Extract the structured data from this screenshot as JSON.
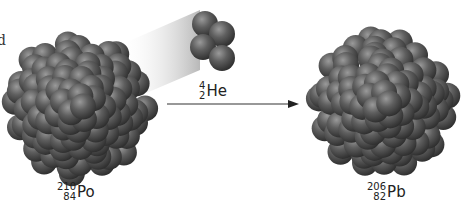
{
  "figure": {
    "edge_text": "d",
    "parent": {
      "mass": "210",
      "atomic": "84",
      "symbol": "Po",
      "nucleons_drawn": 90
    },
    "alpha": {
      "mass": "4",
      "atomic": "2",
      "symbol": "He",
      "nucleons_drawn": 4
    },
    "daughter": {
      "mass": "206",
      "atomic": "82",
      "symbol": "Pb",
      "nucleons_drawn": 86
    },
    "arrow": {
      "direction": "right"
    },
    "colors": {
      "nucleon": "#5a5a5a",
      "nucleon_highlight": "#9a9a9a",
      "nucleon_shadow": "#2e2e2e",
      "arrow": "#333333",
      "beam": "#bdbdbd"
    }
  }
}
